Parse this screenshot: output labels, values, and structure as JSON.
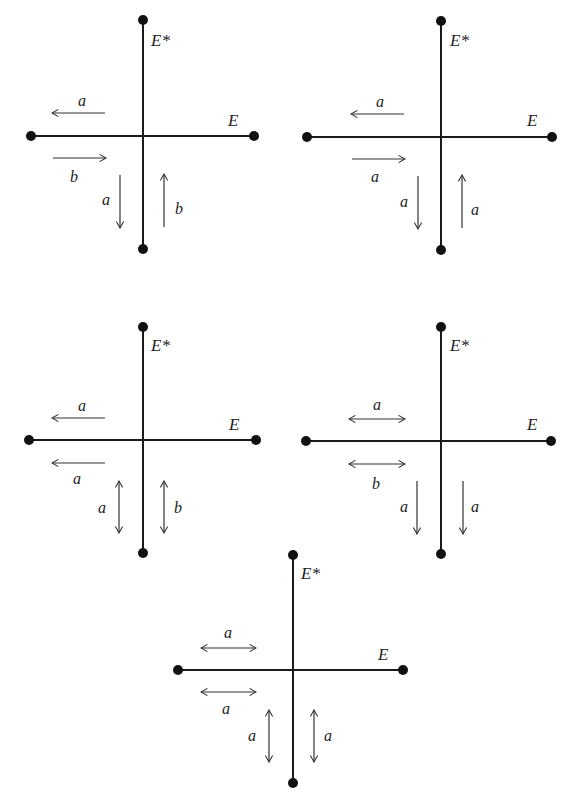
{
  "figure": {
    "panel_count": 5,
    "axis_labels": {
      "horizontal": "E",
      "vertical": "E*"
    },
    "panels": [
      {
        "id": 1,
        "upper_left_arrow": {
          "direction": "left",
          "label": "a"
        },
        "lower_left_arrow": {
          "direction": "right",
          "label": "b"
        },
        "left_vertical_arrow": {
          "direction": "down",
          "label": "a"
        },
        "right_vertical_arrow": {
          "direction": "up",
          "label": "b"
        }
      },
      {
        "id": 2,
        "upper_left_arrow": {
          "direction": "left",
          "label": "a"
        },
        "lower_left_arrow": {
          "direction": "right",
          "label": "a"
        },
        "left_vertical_arrow": {
          "direction": "down",
          "label": "a"
        },
        "right_vertical_arrow": {
          "direction": "up",
          "label": "a"
        }
      },
      {
        "id": 3,
        "upper_left_arrow": {
          "direction": "left",
          "label": "a"
        },
        "lower_left_arrow": {
          "direction": "left",
          "label": "a"
        },
        "left_vertical_arrow": {
          "direction": "both",
          "label": "a"
        },
        "right_vertical_arrow": {
          "direction": "both",
          "label": "b"
        }
      },
      {
        "id": 4,
        "upper_left_arrow": {
          "direction": "both",
          "label": "a"
        },
        "lower_left_arrow": {
          "direction": "both",
          "label": "b"
        },
        "left_vertical_arrow": {
          "direction": "down",
          "label": "a"
        },
        "right_vertical_arrow": {
          "direction": "down",
          "label": "a"
        }
      },
      {
        "id": 5,
        "upper_left_arrow": {
          "direction": "both",
          "label": "a"
        },
        "lower_left_arrow": {
          "direction": "both",
          "label": "a"
        },
        "left_vertical_arrow": {
          "direction": "both",
          "label": "a"
        },
        "right_vertical_arrow": {
          "direction": "both",
          "label": "a"
        }
      }
    ]
  }
}
